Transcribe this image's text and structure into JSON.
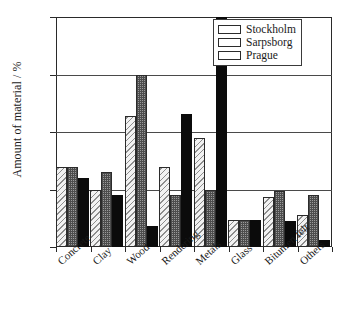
{
  "chart_data": {
    "type": "bar",
    "title": "",
    "xlabel": "",
    "ylabel": "Amount of material / %",
    "ylim": [
      0,
      40
    ],
    "yticks": [
      0,
      10,
      20,
      30,
      40
    ],
    "grid": true,
    "legend_position": "top-right",
    "categories": [
      "Concrete",
      "Clay",
      "Wood",
      "Rendering",
      "Metals",
      "Glass",
      "Bitumen felt",
      "Others"
    ],
    "series": [
      {
        "name": "Stockholm",
        "pattern": "diagonal-hatch",
        "color": "#f2f2f2",
        "values": [
          14.0,
          9.9,
          22.7,
          13.9,
          19.0,
          4.7,
          8.7,
          5.6
        ]
      },
      {
        "name": "Sarpsborg",
        "pattern": "dark-stipple",
        "color": "#9a9a9a",
        "values": [
          14.0,
          13.0,
          30.0,
          9.0,
          9.9,
          4.7,
          9.8,
          9.0
        ]
      },
      {
        "name": "Prague",
        "pattern": "solid",
        "color": "#0b0b0b",
        "values": [
          12.0,
          9.0,
          3.7,
          23.2,
          40.0,
          4.7,
          4.6,
          1.3
        ]
      }
    ]
  }
}
